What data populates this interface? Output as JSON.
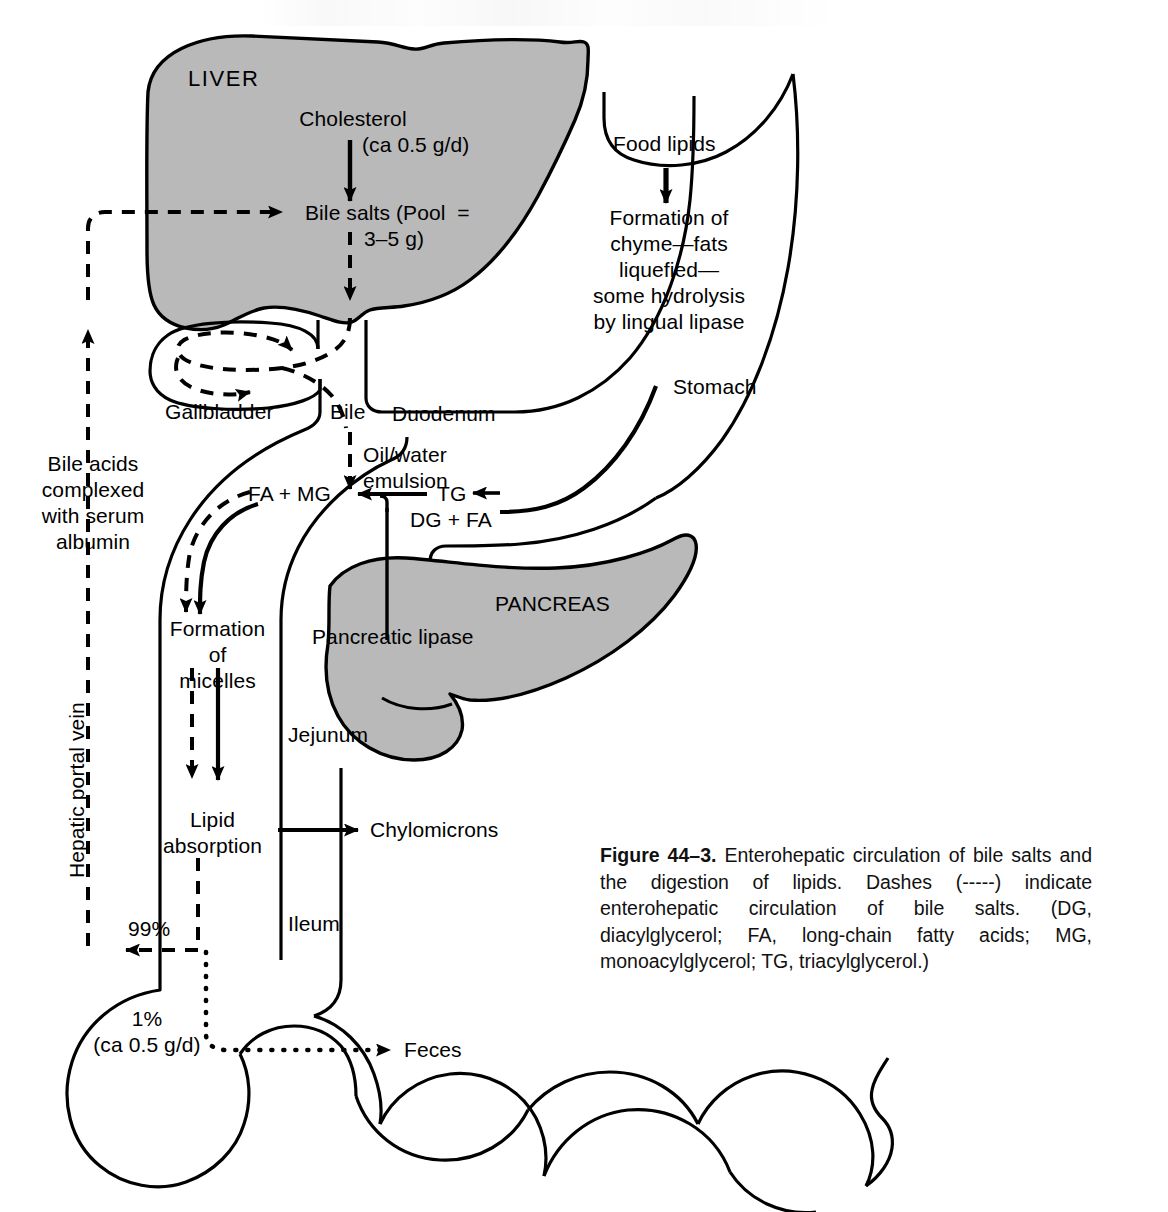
{
  "figure": {
    "number": "Figure 44–3.",
    "caption": " Enterohepatic circulation of bile salts and the digestion of lipids. Dashes (-----) indicate enterohepatic circulation of bile salts. (DG, diacylglycerol; FA, long-chain fatty acids; MG, monoacylglycerol; TG, triacylglycerol.)"
  },
  "organs": {
    "liver": "LIVER",
    "gallbladder": "Gallbladder",
    "duodenum": "Duodenum",
    "stomach": "Stomach",
    "pancreas": "PANCREAS",
    "jejunum": "Jejunum",
    "ileum": "Ileum"
  },
  "nodes": {
    "cholesterol": "Cholesterol",
    "cholesterol_rate": "(ca 0.5 g/d)",
    "bile_salts_l1": "Bile salts (Pool  =",
    "bile_salts_l2": "3–5 g)",
    "bile": "Bile",
    "oil_water_l1": "Oil/water",
    "oil_water_l2": "emulsion",
    "fa_mg": "FA + MG",
    "tg": "TG",
    "dg_fa": "DG + FA",
    "food_lipids": "Food lipids",
    "chyme_l1": "Formation of",
    "chyme_l2": "chyme—fats",
    "chyme_l3": "liquefied—",
    "chyme_l4": "some hydrolysis",
    "chyme_l5": "by lingual lipase",
    "pancreatic_lipase": "Pancreatic lipase",
    "micelles_l1": "Formation",
    "micelles_l2": "of",
    "micelles_l3": "micelles",
    "absorption_l1": "Lipid",
    "absorption_l2": "absorption",
    "chylomicrons": "Chylomicrons",
    "bile_acids_l1": "Bile acids",
    "bile_acids_l2": "complexed",
    "bile_acids_l3": "with serum",
    "bile_acids_l4": "albumin",
    "hepatic_portal_vein": "Hepatic portal vein",
    "pct_99": "99%",
    "pct_1": "1%",
    "pct_1_rate": "(ca 0.5 g/d)",
    "feces": "Feces"
  },
  "colors": {
    "organ_fill": "#b9b9b9",
    "stroke": "#000000",
    "background": "#ffffff",
    "text": "#000000"
  }
}
